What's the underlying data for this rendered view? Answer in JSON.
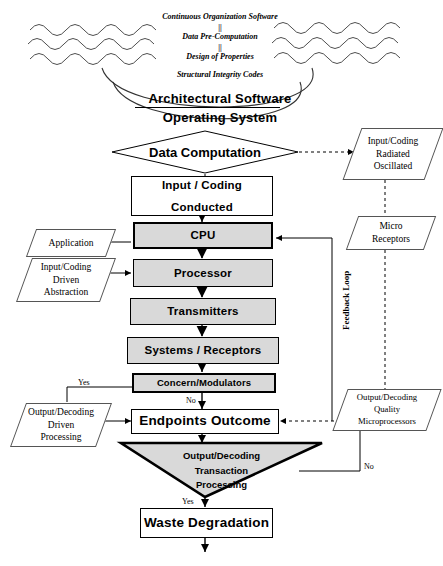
{
  "diagram": {
    "colors": {
      "fill_gray": "#d9d9d9",
      "fill_white": "#ffffff",
      "stroke": "#000000",
      "stroke_light": "#555555"
    },
    "header_notes": [
      {
        "text": "Continuous Organization Software"
      },
      {
        "text": "||"
      },
      {
        "text": "Data Pre-Computation"
      },
      {
        "text": "||"
      },
      {
        "text": "Design of Properties"
      },
      {
        "text": "Structural Integrity Codes"
      }
    ],
    "banners": [
      {
        "text": "Architectural Software"
      },
      {
        "text": "Operating System"
      }
    ],
    "decision_diamond": {
      "label": "Data Computation"
    },
    "process_nodes": [
      {
        "id": "input_coding",
        "line1": "Input / Coding",
        "line2": "Conducted"
      },
      {
        "id": "cpu",
        "label": "CPU"
      },
      {
        "id": "processor",
        "label": "Processor"
      },
      {
        "id": "transmitters",
        "label": "Transmitters"
      },
      {
        "id": "systems_receptors",
        "label": "Systems / Receptors"
      },
      {
        "id": "concern_modulators",
        "label": "Concern/Modulators"
      },
      {
        "id": "endpoints_outcome",
        "label": "Endpoints Outcome"
      },
      {
        "id": "waste_degradation",
        "label": "Waste Degradation"
      }
    ],
    "io_nodes": [
      {
        "id": "input_coding_radiated",
        "lines": [
          "Input/Coding",
          "Radiated",
          "Oscillated"
        ]
      },
      {
        "id": "application",
        "lines": [
          "Application"
        ]
      },
      {
        "id": "input_coding_driven",
        "lines": [
          "Input/Coding",
          "Driven",
          "Abstraction"
        ]
      },
      {
        "id": "micro_receptors",
        "lines": [
          "Micro",
          "Receptors"
        ]
      },
      {
        "id": "output_decoding_driven",
        "lines": [
          "Output/Decoding",
          "Driven",
          "Processing"
        ]
      },
      {
        "id": "output_decoding_quality",
        "lines": [
          "Output/Decoding",
          "Quality",
          "Microprocessors"
        ]
      }
    ],
    "triangle_decision": {
      "lines": [
        "Output/Decoding",
        "Transaction",
        "Processing"
      ]
    },
    "edge_labels": [
      {
        "id": "yes_concern",
        "text": "Yes"
      },
      {
        "id": "no_concern",
        "text": "No"
      },
      {
        "id": "no_triangle",
        "text": "No"
      },
      {
        "id": "yes_triangle",
        "text": "Yes"
      }
    ],
    "side_labels": [
      {
        "id": "feedback_loop",
        "text": "Feedback Loop"
      }
    ]
  }
}
